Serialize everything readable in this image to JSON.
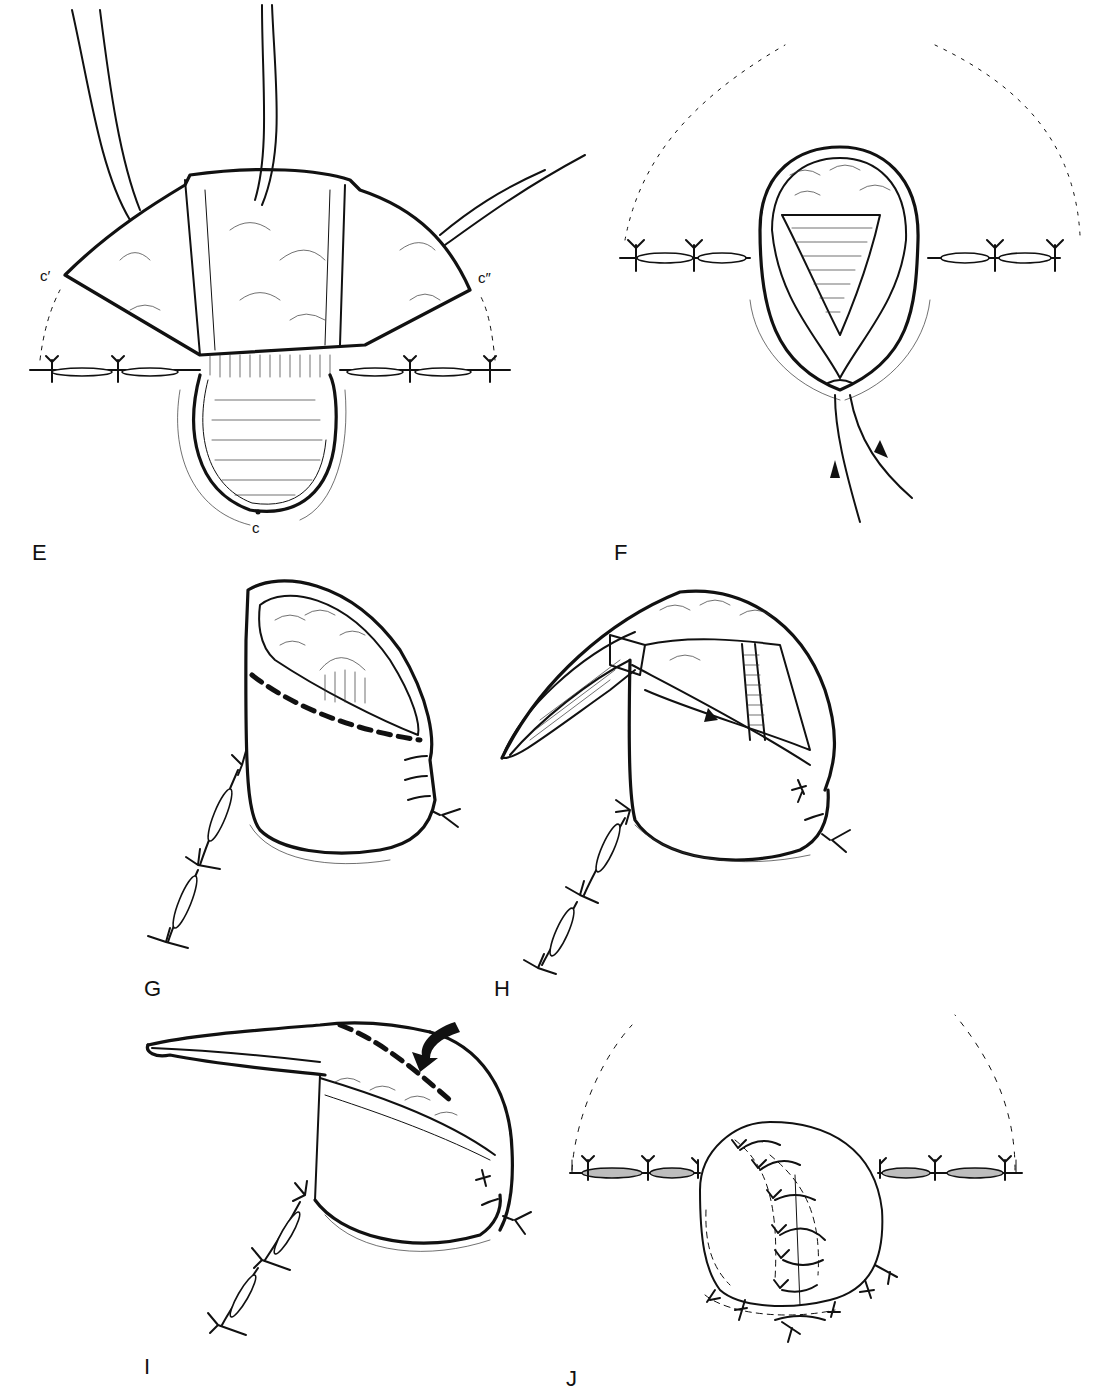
{
  "figure": {
    "panels": [
      {
        "id": "E",
        "label": "E",
        "description": "Flap with three retraction sutures, stoma pouch below closed incision"
      },
      {
        "id": "F",
        "label": "F",
        "description": "Opened pouch with inner lumen; sutures with directional arrows"
      },
      {
        "id": "G",
        "label": "G",
        "description": "Cylindrical pouch with heavy dashed incision line"
      },
      {
        "id": "H",
        "label": "H",
        "description": "Pouch with flap turned back exposing interior"
      },
      {
        "id": "I",
        "label": "I",
        "description": "Flap folded over with dashed line and curved arrow"
      },
      {
        "id": "J",
        "label": "J",
        "description": "Completed closure with stitched round stoma"
      }
    ],
    "point_labels": {
      "c_prime": "c′",
      "c_double_prime": "c″",
      "c": "c"
    },
    "colors": {
      "ink": "#111111",
      "background": "#ffffff",
      "wound_fill": "#bdbdbd"
    }
  }
}
